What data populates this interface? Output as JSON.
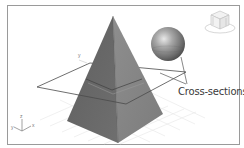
{
  "viewport": {
    "background": "#ffffff",
    "frame_color": "#9a9a9a"
  },
  "scene": {
    "objects": [
      {
        "name": "pyramid",
        "left_face_color": "#6e6e6e",
        "right_face_color": "#8c8c8c"
      },
      {
        "name": "sphere",
        "color": "#8a8a8a"
      },
      {
        "name": "cutting-plane",
        "stroke": "#4a4a4a"
      }
    ],
    "grid_color": "#e4e4e4"
  },
  "annotation": {
    "label": "Cross-sections",
    "leader_color": "#555555"
  },
  "viewcube": {
    "icon": "viewcube-icon"
  },
  "axis_tripod": {
    "icon": "axis-tripod-icon",
    "z_label": "z",
    "y_label": "y",
    "x_label": "x"
  },
  "plane_axis_label": "y"
}
